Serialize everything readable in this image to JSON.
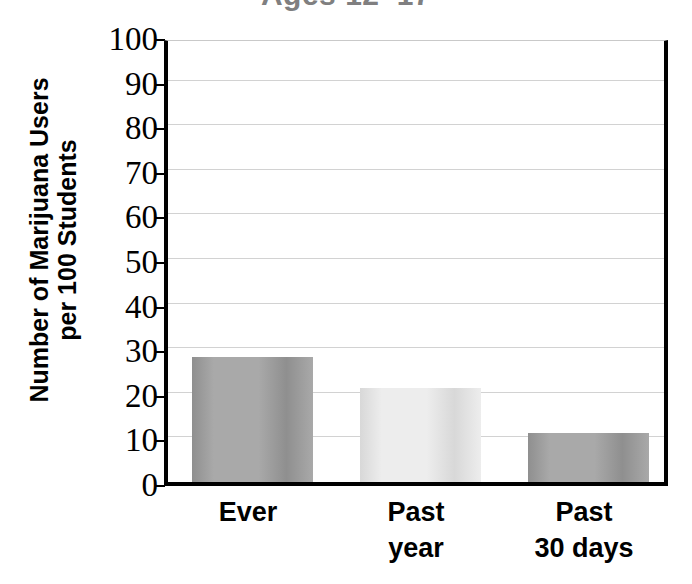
{
  "chart_data": {
    "type": "bar",
    "title": "Ages 12–17",
    "title_clipped": true,
    "xlabel": "",
    "ylabel": "Number of Marijuana Users per 100 Students",
    "ylabel_lines": [
      "Number of Marijuana Users",
      "per 100 Students"
    ],
    "categories": [
      "Ever",
      "Past year",
      "Past 30 days"
    ],
    "category_lines": [
      [
        "Ever"
      ],
      [
        "Past",
        "year"
      ],
      [
        "Past",
        "30 days"
      ]
    ],
    "values": [
      28,
      21,
      11
    ],
    "ylim": [
      0,
      100
    ],
    "ytick_step": 10,
    "yticks": [
      0,
      10,
      20,
      30,
      40,
      50,
      60,
      70,
      80,
      90,
      100
    ],
    "ytick_labels": [
      "0",
      "10",
      "20",
      "30",
      "40",
      "50",
      "60",
      "70",
      "80",
      "90",
      "100"
    ],
    "grid": true,
    "grid_axis": "y",
    "legend": false,
    "legend_position": "none",
    "bar_colors": [
      "#a9a9a9",
      "#ededed",
      "#a9a9a9"
    ],
    "bar_edge_colors": [
      "#8f8f8f",
      "#d8d8d8",
      "#8f8f8f"
    ],
    "colors": {
      "axis": "#000000",
      "gridline": "#d2d2d2",
      "title_text": "#807f80",
      "label_text": "#000000",
      "background": "#ffffff"
    }
  }
}
